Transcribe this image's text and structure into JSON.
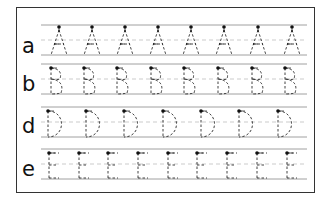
{
  "worksheet": {
    "title": "Letter tracing practice",
    "rows": [
      {
        "label": "a",
        "trace_letter": "A",
        "count": 8,
        "top": 17,
        "positions": [
          42,
          75,
          108,
          141,
          174,
          207,
          241,
          275
        ]
      },
      {
        "label": "b",
        "trace_letter": "B",
        "count": 8,
        "top": 56,
        "positions": [
          34,
          67,
          100,
          134,
          167,
          201,
          235,
          268
        ]
      },
      {
        "label": "d",
        "trace_letter": "D",
        "count": 7,
        "top": 99,
        "positions": [
          31,
          69,
          107,
          146,
          184,
          222,
          261
        ]
      },
      {
        "label": "e",
        "trace_letter": "E",
        "count": 9,
        "top": 141,
        "positions": [
          32,
          62,
          91,
          121,
          151,
          180,
          210,
          240,
          270
        ]
      }
    ],
    "colors": {
      "ink": "#111111",
      "guide": "#888888",
      "dash": "#aaaaaa"
    }
  }
}
